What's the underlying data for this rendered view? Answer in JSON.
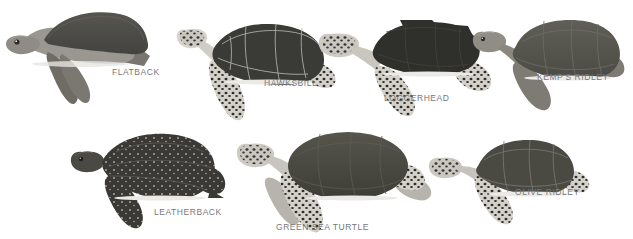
{
  "figure": {
    "background_color": "#ffffff",
    "label_color": "#77787a",
    "rows": 2
  },
  "species": [
    {
      "id": "flatback",
      "label": "FLATBACK",
      "view": "side-profile",
      "row": 1,
      "label_x": 112,
      "label_y": 72,
      "shell_color": "#4c4b47",
      "body_color": "#9a9790",
      "flipper_color": "#6e6c65",
      "shell_highlight": "#5c5b56",
      "pattern": "smooth-domed-carapace"
    },
    {
      "id": "hawksbill",
      "label": "HAWKSBILL",
      "view": "top-down",
      "row": 1,
      "label_x": 265,
      "label_y": 82,
      "shell_color": "#3a3a36",
      "body_color": "#c9c7bf",
      "flipper_color": "#d6d4cc",
      "shell_highlight": "#4a4a45",
      "scute_line_color": "#b9b7ae",
      "pattern": "serrated-shell-spotted-flippers"
    },
    {
      "id": "loggerhead",
      "label": "LOGGERHEAD",
      "view": "top-down",
      "row": 1,
      "label_x": 385,
      "label_y": 97,
      "shell_color": "#2f2f2c",
      "body_color": "#c8c6be",
      "flipper_color": "#d3d1c9",
      "shell_highlight": "#3d3d39",
      "pattern": "large-head-blocky-scutes-spotted-flippers"
    },
    {
      "id": "kemps-ridley",
      "label": "KEMP'S RIDLEY",
      "view": "top-down",
      "row": 1,
      "label_x": 538,
      "label_y": 76,
      "shell_color": "#55554e",
      "body_color": "#8f8d84",
      "flipper_color": "#7d7b73",
      "shell_highlight": "#62625b",
      "scute_line_color": "#6e6e66",
      "pattern": "round-grey-carapace"
    },
    {
      "id": "leatherback",
      "label": "LEATHERBACK",
      "view": "top-down",
      "row": 2,
      "label_x": 155,
      "label_y": 211,
      "shell_color": "#3a3935",
      "body_color": "#4a4944",
      "flipper_color": "#333330",
      "shell_highlight": "#46453f",
      "speckle_color": "#b9b6ab",
      "pattern": "ridged-leathery-white-speckles"
    },
    {
      "id": "green-sea-turtle",
      "label": "GREEN SEA TURTLE",
      "view": "top-down",
      "row": 2,
      "label_x": 277,
      "label_y": 226,
      "shell_color": "#46463f",
      "body_color": "#c7c5bd",
      "flipper_color": "#cecbc3",
      "shell_highlight": "#55554d",
      "pattern": "oval-shell-spotted-head-and-flippers"
    },
    {
      "id": "olive-ridley",
      "label": "OLIVE RIDLEY",
      "view": "top-down",
      "row": 2,
      "label_x": 516,
      "label_y": 191,
      "shell_color": "#4a4a43",
      "body_color": "#c5c3bb",
      "flipper_color": "#cbc9c1",
      "shell_highlight": "#57574f",
      "scute_line_color": "#7b7b72",
      "pattern": "heart-shaped-olive-carapace"
    }
  ]
}
